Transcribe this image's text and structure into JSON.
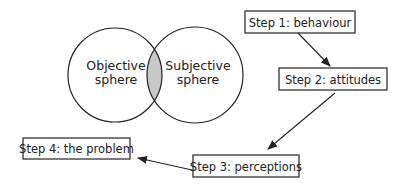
{
  "diagram": {
    "venn": {
      "left": {
        "line1": "Objective",
        "line2": "sphere"
      },
      "right": {
        "line1": "Subjective",
        "line2": "sphere"
      },
      "overlap_fill": "#c8c8c8"
    },
    "steps": [
      {
        "label": "Step 1: behaviour"
      },
      {
        "label": "Step 2: attitudes"
      },
      {
        "label": "Step 3: perceptions"
      },
      {
        "label": "Step 4: the problem"
      }
    ],
    "colors": {
      "stroke": "#222222",
      "background": "#ffffff"
    }
  }
}
